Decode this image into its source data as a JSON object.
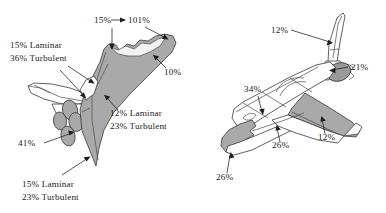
{
  "figure": {
    "background_color": "#ffffff",
    "shade_color": "#a9a9a9",
    "outline_color": "#3a3a3a",
    "text_color": "#1c1c1c",
    "views": [
      {
        "name": "planform-view",
        "description": "Shuttle orbiter planform (top) view, shaded wing and body",
        "labels": [
          {
            "id": "top-left-pct",
            "text": "15%",
            "x": 94,
            "y": 23
          },
          {
            "id": "top-right-pct",
            "text": "101%",
            "x": 128,
            "y": 23
          },
          {
            "id": "wing-tip-pct",
            "text": "10%",
            "x": 164,
            "y": 75
          },
          {
            "id": "upper-left-laminar",
            "text": "15% Laminar",
            "x": 10,
            "y": 48
          },
          {
            "id": "upper-left-turbulent",
            "text": "36% Turbulent",
            "x": 10,
            "y": 61
          },
          {
            "id": "engine-pct",
            "text": "41%",
            "x": 18,
            "y": 146
          },
          {
            "id": "wing-laminar",
            "text": "12% Laminar",
            "x": 110,
            "y": 116
          },
          {
            "id": "wing-turbulent",
            "text": "23% Turbulent",
            "x": 110,
            "y": 129
          },
          {
            "id": "bottom-laminar",
            "text": "15% Laminar",
            "x": 22,
            "y": 187
          },
          {
            "id": "bottom-turbulent",
            "text": "23% Turbulent",
            "x": 22,
            "y": 200
          }
        ]
      },
      {
        "name": "perspective-view",
        "description": "Shuttle orbiter three-quarter perspective view with shaded leading edges",
        "labels": [
          {
            "id": "tail-pct",
            "text": "12%",
            "x": 271,
            "y": 33
          },
          {
            "id": "omspod-pct",
            "text": "21%",
            "x": 351,
            "y": 70
          },
          {
            "id": "fuselage-pct",
            "text": "34%",
            "x": 244,
            "y": 92
          },
          {
            "id": "wing-edge-pct",
            "text": "12%",
            "x": 318,
            "y": 140
          },
          {
            "id": "wing-root-pct",
            "text": "26%",
            "x": 272,
            "y": 148
          },
          {
            "id": "nose-pct",
            "text": "26%",
            "x": 216,
            "y": 180
          }
        ]
      }
    ]
  }
}
